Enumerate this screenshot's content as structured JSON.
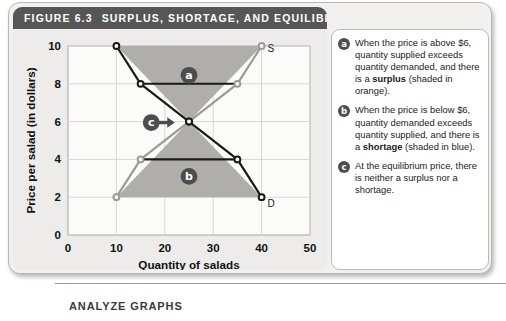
{
  "figure": {
    "number": "FIGURE 6.3",
    "title": "SURPLUS, SHORTAGE, AND EQUILIBRIUM"
  },
  "callouts": [
    {
      "badge": "a",
      "text_parts": [
        {
          "t": "When the price is above $6, quantity supplied exceeds quantity demanded, and there is a ",
          "bold": false
        },
        {
          "t": "surplus",
          "bold": true
        },
        {
          "t": " (shaded in orange).",
          "bold": false
        }
      ]
    },
    {
      "badge": "b",
      "text_parts": [
        {
          "t": "When the price is below $6, quantity demanded exceeds quantity supplied, and there is a ",
          "bold": false
        },
        {
          "t": "shortage",
          "bold": true
        },
        {
          "t": " (shaded in blue).",
          "bold": false
        }
      ]
    },
    {
      "badge": "c",
      "text_parts": [
        {
          "t": "At the equilibrium price, there is neither a surplus nor a shortage.",
          "bold": false
        }
      ]
    }
  ],
  "bottom": {
    "analyze_label": "ANALYZE GRAPHS"
  },
  "colors": {
    "title_bar": "#565656",
    "panel_bg": "#edecea",
    "card_bg": "#f2f1ef",
    "demand_curve": "#1a1a1a",
    "supply_curve": "#9a9a9a",
    "surplus_fill": "#b0aeab",
    "shortage_fill": "#b0aeab",
    "badge": "#4d4d4d",
    "gridline": "#d8d7d4"
  },
  "chart_data": {
    "type": "line",
    "title": "SURPLUS, SHORTAGE, AND EQUILIBRIUM",
    "xlabel": "Quantity of salads",
    "ylabel": "Price per salad (in dollars)",
    "xlim": [
      0,
      50
    ],
    "ylim": [
      0,
      10
    ],
    "xticks": [
      0,
      10,
      20,
      30,
      40,
      50
    ],
    "yticks": [
      0,
      2,
      4,
      6,
      8,
      10
    ],
    "grid": true,
    "series": [
      {
        "name": "D",
        "label": "D",
        "color": "#1a1a1a",
        "points": [
          {
            "x": 10,
            "y": 10
          },
          {
            "x": 15,
            "y": 8
          },
          {
            "x": 25,
            "y": 6
          },
          {
            "x": 35,
            "y": 4
          },
          {
            "x": 40,
            "y": 2
          }
        ]
      },
      {
        "name": "S",
        "label": "S",
        "color": "#9a9a9a",
        "points": [
          {
            "x": 10,
            "y": 2
          },
          {
            "x": 15,
            "y": 4
          },
          {
            "x": 25,
            "y": 6
          },
          {
            "x": 35,
            "y": 8
          },
          {
            "x": 40,
            "y": 10
          }
        ]
      }
    ],
    "connectors": [
      {
        "y": 8,
        "x_start": 15,
        "x_end": 35
      },
      {
        "y": 4,
        "x_start": 15,
        "x_end": 35
      }
    ],
    "regions": [
      {
        "name": "surplus",
        "badge": "a",
        "badge_at": {
          "x": 25,
          "y": 8.45
        },
        "polygon": [
          {
            "x": 10,
            "y": 10
          },
          {
            "x": 40,
            "y": 10
          },
          {
            "x": 25,
            "y": 6
          }
        ]
      },
      {
        "name": "shortage",
        "badge": "b",
        "badge_at": {
          "x": 25,
          "y": 3.1
        },
        "polygon": [
          {
            "x": 10,
            "y": 2
          },
          {
            "x": 40,
            "y": 2
          },
          {
            "x": 25,
            "y": 6
          }
        ]
      }
    ],
    "equilibrium": {
      "x": 25,
      "y": 6,
      "badge": "c",
      "badge_at": {
        "x": 17.2,
        "y": 5.95
      }
    },
    "annotations": [
      {
        "text": "S",
        "x": 40,
        "y": 10,
        "series": "supply-endpoint"
      },
      {
        "text": "D",
        "x": 40,
        "y": 2,
        "series": "demand-endpoint"
      }
    ]
  }
}
